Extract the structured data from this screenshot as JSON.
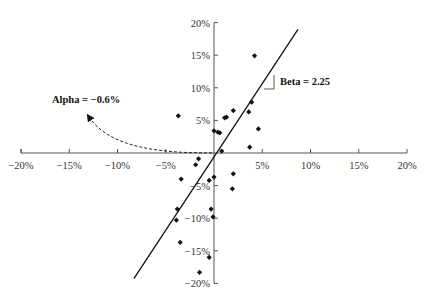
{
  "chart_data": {
    "type": "scatter",
    "title": "",
    "xlabel": "",
    "ylabel": "",
    "xlim": [
      -20,
      20
    ],
    "ylim": [
      -20,
      20
    ],
    "grid": false,
    "legend": null,
    "x_ticks": [
      "−20%",
      "−15%",
      "−10%",
      "−5%",
      "5%",
      "10%",
      "15%",
      "20%"
    ],
    "x_tick_values": [
      -20,
      -15,
      -10,
      -5,
      5,
      10,
      15,
      20
    ],
    "y_ticks": [
      "20%",
      "15%",
      "10%",
      "5%",
      "−5%",
      "−10%",
      "−15%",
      "−20%"
    ],
    "y_tick_values": [
      20,
      15,
      10,
      5,
      -5,
      -10,
      -15,
      -20
    ],
    "series": [
      {
        "name": "Returns",
        "marker": "diamond",
        "points": [
          [
            4.2,
            14.9
          ],
          [
            3.9,
            7.8
          ],
          [
            3.6,
            6.3
          ],
          [
            4.6,
            3.7
          ],
          [
            3.7,
            0.9
          ],
          [
            2.0,
            6.5
          ],
          [
            1.3,
            5.5
          ],
          [
            1.1,
            5.4
          ],
          [
            0.0,
            3.4
          ],
          [
            0.4,
            3.2
          ],
          [
            0.6,
            3.1
          ],
          [
            -3.7,
            5.7
          ],
          [
            0.8,
            0.3
          ],
          [
            -1.6,
            -0.9
          ],
          [
            -1.9,
            -1.8
          ],
          [
            -3.4,
            -4.0
          ],
          [
            -0.5,
            -4.2
          ],
          [
            0.0,
            -3.7
          ],
          [
            2.0,
            -3.2
          ],
          [
            1.9,
            -5.5
          ],
          [
            -3.8,
            -8.6
          ],
          [
            -3.9,
            -10.3
          ],
          [
            -0.3,
            -8.6
          ],
          [
            -0.1,
            -9.8
          ],
          [
            -3.5,
            -13.7
          ],
          [
            -0.5,
            -16.0
          ],
          [
            -1.5,
            -18.3
          ]
        ]
      }
    ],
    "regression_line": {
      "alpha": -0.6,
      "beta": 2.25,
      "x_range": [
        -8.3,
        8.7
      ]
    },
    "annotations": [
      {
        "text": "Alpha = −0.6%",
        "target": "intercept",
        "style": "dashed curved arrow"
      },
      {
        "text": "Beta = 2.25",
        "target": "slope",
        "style": "slope triangle"
      }
    ]
  },
  "labels": {
    "alpha": "Alpha = −0.6%",
    "beta": "Beta = 2.25"
  }
}
